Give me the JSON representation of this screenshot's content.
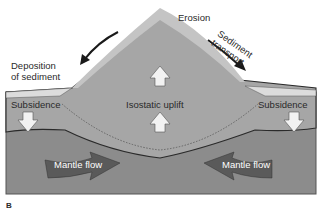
{
  "diagram": {
    "panel_label": "B",
    "labels": {
      "erosion": "Erosion",
      "sediment_transport_line1": "Sediment",
      "sediment_transport_line2": "transport",
      "deposition_line1": "Deposition",
      "deposition_line2": "of sediment",
      "subsidence_left": "Subsidence",
      "subsidence_right": "Subsidence",
      "isostatic_uplift": "Isostatic uplift",
      "mantle_flow_left": "Mantle flow",
      "mantle_flow_right": "Mantle flow"
    },
    "colors": {
      "mantle": "#8c8c8c",
      "crust": "#a6a6a6",
      "erosion_layer": "#c4c4c4",
      "sediment": "#dcdcdc",
      "arrow_dark": "#5a5a5a",
      "arrow_light": "#f2f2f2",
      "outline": "#2a2a2a"
    }
  }
}
